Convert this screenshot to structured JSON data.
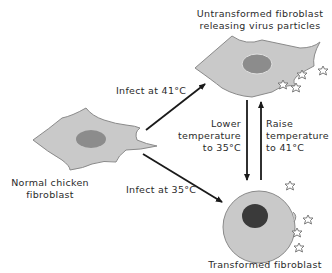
{
  "labels": {
    "untransformed_line1": "Untransformed fibroblast",
    "untransformed_line2": "releasing virus particles",
    "normal_line1": "Normal chicken",
    "normal_line2": "fibroblast",
    "infect_41": "Infect at 41°C",
    "infect_35": "Infect at 35°C",
    "lower_line1": "Lower",
    "lower_line2": "temperature",
    "lower_line3": "to 35°C",
    "raise_line1": "Raise",
    "raise_line2": "temperature",
    "raise_line3": "to 41°C",
    "transformed": "Transformed fibroblast"
  },
  "colors": {
    "cell_fill": "#c9c9c9",
    "cell_stroke": "#8a8a8a",
    "nucleus_fill": "#8c8c8c",
    "transformed_nucleus_fill": "#3a3a3a",
    "arrow": "#1a1a1a",
    "virus": "#7a7a7a",
    "text": "#2a2a2a"
  }
}
